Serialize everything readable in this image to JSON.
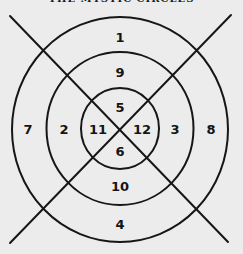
{
  "title": "THE MYSTIC CIRCLES",
  "diagram": {
    "center": [
      120,
      129
    ],
    "stroke_color": "#161616",
    "background": "#ececec",
    "circles": [
      {
        "name": "outer",
        "rx": 108,
        "ry": 112
      },
      {
        "name": "middle",
        "rx": 73,
        "ry": 77
      },
      {
        "name": "inner",
        "rx": 39,
        "ry": 40
      }
    ],
    "lines": [
      {
        "name": "diagonal-tl-br",
        "from": [
          10,
          16
        ],
        "to": [
          228,
          242
        ]
      },
      {
        "name": "diagonal-tr-bl",
        "from": [
          231,
          15
        ],
        "to": [
          10,
          243
        ]
      }
    ],
    "numbers": {
      "top_outer": "1",
      "top_middle": "9",
      "top_inner": "5",
      "bottom_inner": "6",
      "bottom_middle": "10",
      "bottom_outer": "4",
      "left_outer": "7",
      "left_middle": "2",
      "left_inner": "11",
      "right_inner": "12",
      "right_middle": "3",
      "right_outer": "8"
    }
  }
}
